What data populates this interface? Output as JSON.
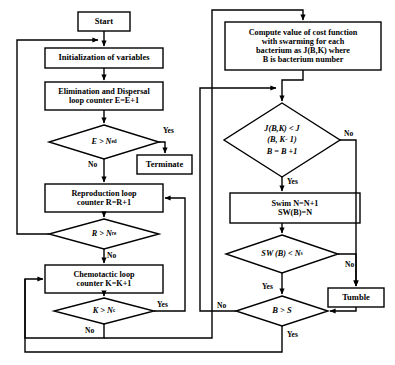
{
  "diagram": {
    "type": "flowchart",
    "stroke_color": "#000000",
    "fill_color": "#ffffff",
    "background": "#ffffff"
  },
  "nodes": {
    "start": {
      "label": "Start",
      "shape": "process"
    },
    "init": {
      "label": "Initialization of variables",
      "shape": "process"
    },
    "elim": {
      "label": "Elimination and Dispersal\nloop counter E=E+1",
      "shape": "process"
    },
    "elim_decision": {
      "label": "E > N",
      "sub": "ed",
      "shape": "decision"
    },
    "terminate": {
      "label": "Terminate",
      "shape": "process"
    },
    "repro": {
      "label": "Reproduction loop\ncounter R=R+1",
      "shape": "process"
    },
    "repro_decision": {
      "label": "R > N",
      "sub": "re",
      "shape": "decision"
    },
    "chemo": {
      "label": "Chemotactic loop\ncounter K=K+1",
      "shape": "process"
    },
    "chemo_decision": {
      "label": "K > N",
      "sub": "c",
      "shape": "decision"
    },
    "compute": {
      "label": "Compute value of cost function\nwith swarming for each\nbacterium as J(B,K) where\nB is bacterium number",
      "shape": "process"
    },
    "cost_decision": {
      "line1": "J(B,K) < J",
      "line2": "(B, K- 1)",
      "line3": "B = B +1",
      "shape": "decision"
    },
    "swim": {
      "label": "Swim N=N+1\nSW(B)=N",
      "shape": "process"
    },
    "swim_decision": {
      "label": "SW (B) < N",
      "sub": "s",
      "shape": "decision"
    },
    "tumble": {
      "label": "Tumble",
      "shape": "process"
    },
    "bs_decision": {
      "label": "B > S",
      "shape": "decision"
    }
  },
  "edge_labels": {
    "elim_yes": "Yes",
    "elim_no": "No",
    "repro_no": "No",
    "chemo_yes": "Yes",
    "chemo_no": "No",
    "cost_no": "No",
    "cost_yes": "Yes",
    "swim_no": "No",
    "swim_yes": "Yes",
    "bs_no": "No",
    "bs_yes": "Yes"
  }
}
